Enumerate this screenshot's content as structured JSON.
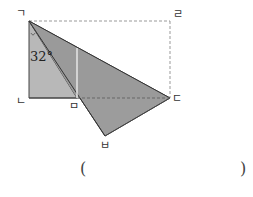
{
  "figure": {
    "vertices": {
      "giyeok": {
        "label": "ㄱ",
        "x": 29,
        "y": 21
      },
      "nieun": {
        "label": "ㄴ",
        "x": 29,
        "y": 98
      },
      "digeut": {
        "label": "ㄷ",
        "x": 170,
        "y": 98
      },
      "rieul": {
        "label": "ㄹ",
        "x": 170,
        "y": 21
      },
      "mieum": {
        "label": "ㅁ",
        "x": 77,
        "y": 98
      },
      "bieup": {
        "label": "ㅂ",
        "x": 105,
        "y": 136
      }
    },
    "angle_label": "32°",
    "colors": {
      "fill_light": "#b4b4b4",
      "fill_dark": "#999999",
      "stroke": "#333333",
      "dashed": "#999999"
    }
  },
  "answer": {
    "open_paren": "(",
    "close_paren": ")"
  }
}
